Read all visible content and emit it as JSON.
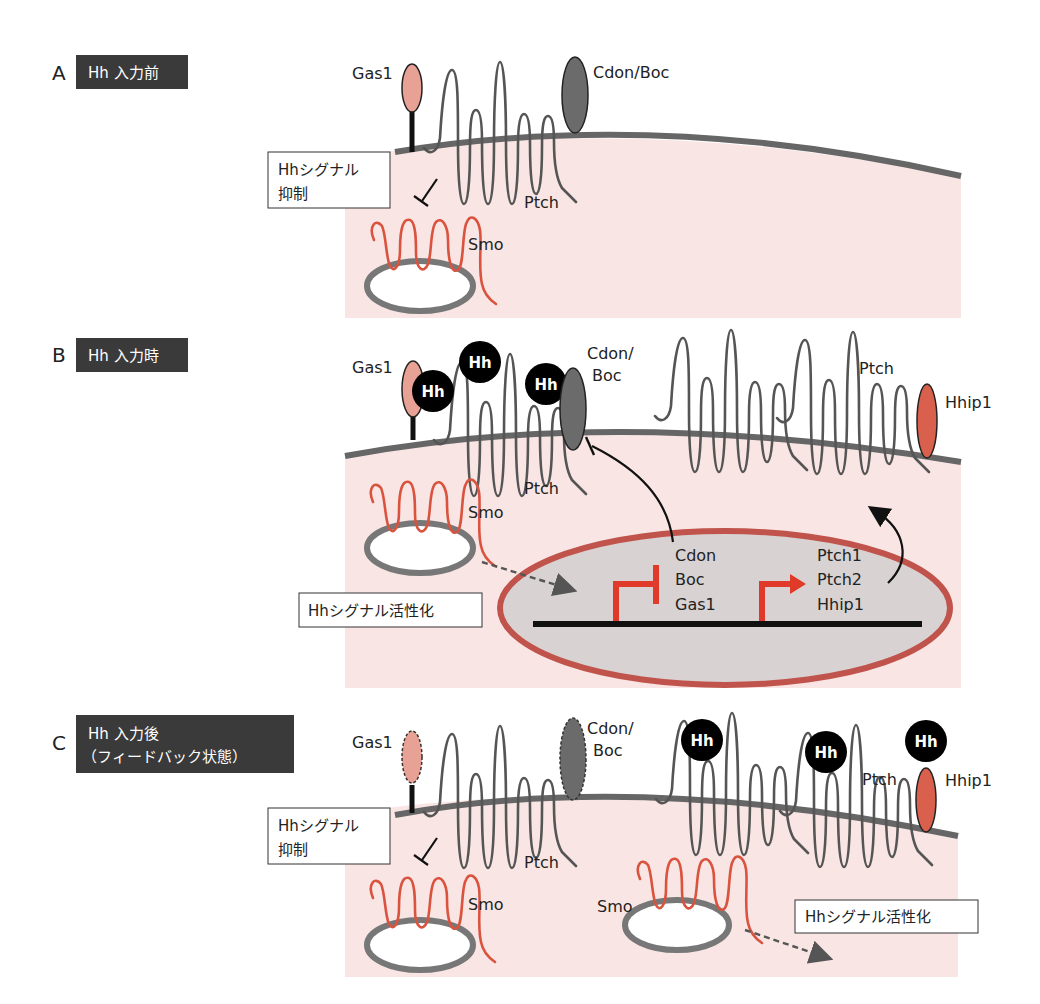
{
  "figure": {
    "colors": {
      "cytoplasm": "#f9e6e4",
      "membrane": "#666666",
      "gas1": "#e8a195",
      "cdon_boc": "#6b6b6b",
      "hhip1": "#d9604d",
      "smo": "#d9533f",
      "hh_ligand": "#000000",
      "nucleus_fill": "#d8d2d2",
      "nucleus_border": "#c0544c",
      "promoter_arrow": "#e03a2a",
      "tag_background": "#3a3a3a"
    }
  },
  "panels": {
    "A": {
      "letter": "A",
      "tag": "Hh 入力前",
      "labels": {
        "gas1": "Gas1",
        "cdon_boc": "Cdon/Boc",
        "ptch": "Ptch",
        "smo": "Smo"
      },
      "box": {
        "line1": "Hhシグナル",
        "line2": "抑制"
      }
    },
    "B": {
      "letter": "B",
      "tag": "Hh 入力時",
      "labels": {
        "gas1": "Gas1",
        "hh": "Hh",
        "cdon_boc_line1": "Cdon/",
        "cdon_boc_line2": "Boc",
        "ptch_left": "Ptch",
        "ptch_right": "Ptch",
        "hhip1": "Hhip1",
        "smo": "Smo"
      },
      "nucleus": {
        "repressed_genes": [
          "Cdon",
          "Boc",
          "Gas1"
        ],
        "induced_genes": [
          "Ptch1",
          "Ptch2",
          "Hhip1"
        ]
      },
      "box": {
        "text": "Hhシグナル活性化"
      }
    },
    "C": {
      "letter": "C",
      "tag_line1": "Hh 入力後",
      "tag_line2": "（フィードバック状態）",
      "labels": {
        "gas1": "Gas1",
        "hh": "Hh",
        "cdon_boc_line1": "Cdon/",
        "cdon_boc_line2": "Boc",
        "ptch_left": "Ptch",
        "ptch_right": "Ptch",
        "hhip1": "Hhip1",
        "smo_left": "Smo",
        "smo_right": "Smo"
      },
      "box_inhibit": {
        "line1": "Hhシグナル",
        "line2": "抑制"
      },
      "box_activate": {
        "text": "Hhシグナル活性化"
      }
    }
  }
}
